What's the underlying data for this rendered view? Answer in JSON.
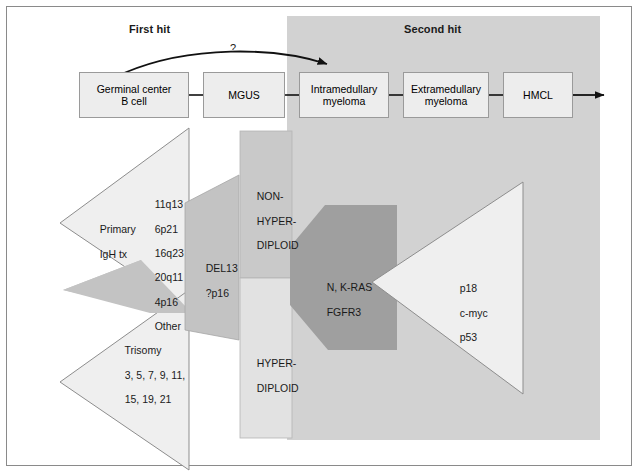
{
  "figure": {
    "phases": [
      {
        "id": "first-hit",
        "label": "First hit"
      },
      {
        "id": "second-hit",
        "label": "Second hit"
      }
    ],
    "uncertainty_marker": "?",
    "colors": {
      "second_hit_background": "#d2d2d2",
      "flow_box_fill": "#ededed",
      "flow_box_stroke": "#9a9a9a",
      "triangle_light_fill": "#efefef",
      "triangle_light_stroke": "#8d8d8d",
      "wedge_mid_fill": "#c3c3c3",
      "wedge_dark_fill": "#9f9f9f",
      "column_dark_fill": "#c9c9c9",
      "column_light_fill": "#e2e2e2",
      "frame_stroke": "#8a8a8a",
      "arrow_stroke": "#111111",
      "text": "#1a1a1a"
    }
  },
  "flow": {
    "steps": [
      {
        "id": "germinal-center-b-cell",
        "lines": [
          "Germinal center",
          "B cell"
        ]
      },
      {
        "id": "mgus",
        "lines": [
          "MGUS"
        ]
      },
      {
        "id": "intramedullary-myeloma",
        "lines": [
          "Intramedullary",
          "myeloma"
        ]
      },
      {
        "id": "extramedullary-myeloma",
        "lines": [
          "Extramedullary",
          "myeloma"
        ]
      },
      {
        "id": "hmcl",
        "lines": [
          "HMCL"
        ]
      }
    ]
  },
  "shapes": {
    "primary_igh_tx": {
      "name": "Primary IgH tx",
      "label_lines": [
        "Primary",
        "IgH tx"
      ],
      "loci": [
        "11q13",
        "6p21",
        "16q23",
        "20q11",
        "4p16",
        "Other"
      ]
    },
    "trisomy": {
      "name": "Trisomy",
      "label_lines": [
        "Trisomy",
        "3, 5, 7, 9, 11,",
        "15, 19, 21"
      ]
    },
    "del13": {
      "name": "DEL13",
      "label_lines": [
        "DEL13",
        "?p16"
      ]
    },
    "ploidy_column": {
      "non_hyperdiploid_lines": [
        "NON-",
        "HYPER-",
        "DIPLOID"
      ],
      "hyperdiploid_lines": [
        "HYPER-",
        "DIPLOID"
      ]
    },
    "ras_wedge": {
      "name": "N, K-RAS / FGFR3",
      "label_lines": [
        "N, K-RAS",
        "FGFR3"
      ]
    },
    "late_events": {
      "name": "late genetic events",
      "label_lines": [
        "p18",
        "c-myc",
        "p53"
      ]
    }
  }
}
